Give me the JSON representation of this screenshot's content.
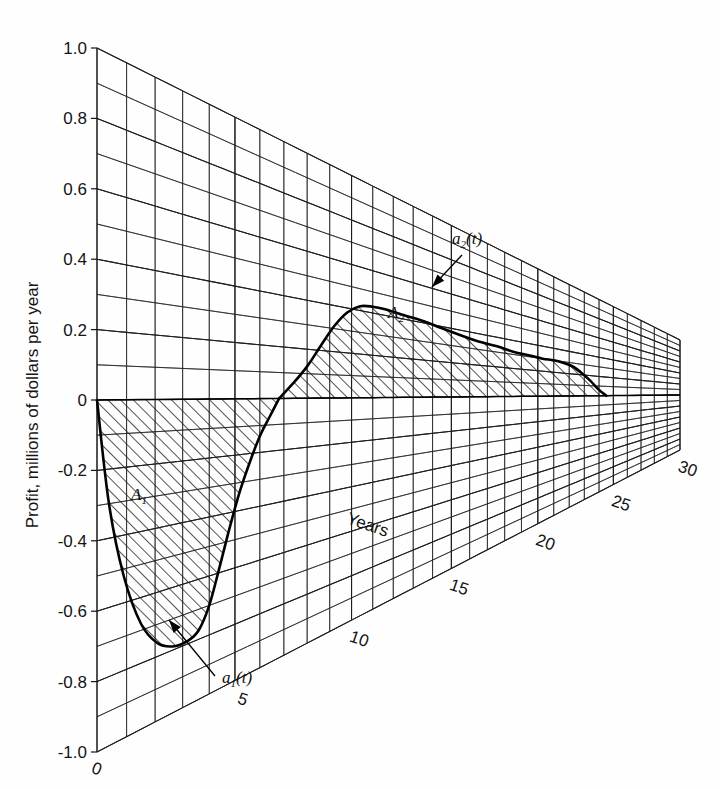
{
  "figure": {
    "kind": "perspective-cash-flow-plot",
    "background_color": "#fefefe",
    "ink_color": "#141414"
  },
  "axes": {
    "y_axis_title": "Profit, millions of dollars per year",
    "y_tick_labels": [
      "1.0",
      "0.8",
      "0.6",
      "0.4",
      "0.2",
      "0",
      "-0.2",
      "-0.4",
      "-0.6",
      "-0.8",
      "-1.0"
    ],
    "y_tick_values": [
      1.0,
      0.8,
      0.6,
      0.4,
      0.2,
      0,
      -0.2,
      -0.4,
      -0.6,
      -0.8,
      -1.0
    ],
    "y_minor_step": 0.1,
    "x_axis_title": "Years",
    "x_tick_labels": [
      "0",
      "5",
      "10",
      "15",
      "20",
      "25",
      "30"
    ],
    "x_tick_values": [
      0,
      5,
      10,
      15,
      20,
      25,
      30
    ],
    "x_minor_step": 1,
    "grid": "on"
  },
  "annotations": {
    "curve1_label": "a",
    "curve1_sub": "1",
    "curve1_arg": "(t)",
    "curve2_label": "a",
    "curve2_sub": "2",
    "curve2_arg": "(t)",
    "area1_label": "A",
    "area1_sub": "1",
    "area2_label": "A",
    "area2_sub": "2"
  },
  "chart_data": {
    "type": "area",
    "title": "",
    "subtitle": "",
    "xlabel": "Years",
    "ylabel": "Profit, millions of dollars per year",
    "xlim": [
      0,
      30
    ],
    "ylim": [
      -1.0,
      1.0
    ],
    "xticks": [
      0,
      5,
      10,
      15,
      20,
      25,
      30
    ],
    "yticks": [
      1.0,
      0.8,
      0.6,
      0.4,
      0.2,
      0,
      -0.2,
      -0.4,
      -0.6,
      -0.8,
      -1.0
    ],
    "grid": true,
    "legend_position": "inline-annotations",
    "projection": "oblique-perspective",
    "series": [
      {
        "name": "a1(t)",
        "role": "negative-cash-flow",
        "fill": "hatched",
        "area_label": "A1",
        "x": [
          0.0,
          0.4,
          0.9,
          1.5,
          2.1,
          2.7,
          3.2,
          3.6,
          4.0,
          4.4,
          4.8,
          5.2,
          5.6,
          6.0,
          6.4,
          6.8
        ],
        "y": [
          0.0,
          -0.3,
          -0.52,
          -0.68,
          -0.76,
          -0.79,
          -0.79,
          -0.77,
          -0.7,
          -0.58,
          -0.45,
          -0.33,
          -0.23,
          -0.14,
          -0.07,
          0.0
        ]
      },
      {
        "name": "a2(t)",
        "role": "positive-cash-flow",
        "fill": "hatched",
        "area_label": "A2",
        "x": [
          6.8,
          7.4,
          8.0,
          8.6,
          9.2,
          9.8,
          10.4,
          11.0,
          11.6,
          12.5,
          13.5,
          14.5,
          15.5,
          16.5,
          17.5,
          18.5,
          19.5,
          20.3,
          21.0,
          21.6,
          22.2,
          22.8,
          23.4,
          24.0,
          24.5
        ],
        "y": [
          0.0,
          0.06,
          0.13,
          0.22,
          0.31,
          0.38,
          0.42,
          0.43,
          0.43,
          0.42,
          0.41,
          0.39,
          0.37,
          0.35,
          0.34,
          0.32,
          0.31,
          0.3,
          0.3,
          0.29,
          0.27,
          0.22,
          0.15,
          0.06,
          0.0
        ]
      }
    ],
    "annotated_points": [
      {
        "label": "minimum of a1(t)",
        "x": 3.4,
        "y": -0.79
      },
      {
        "label": "zero crossing",
        "x": 6.8,
        "y": 0.0
      },
      {
        "label": "maximum of a2(t)",
        "x": 11.2,
        "y": 0.43
      },
      {
        "label": "end of a2(t)",
        "x": 24.5,
        "y": 0.0
      }
    ]
  }
}
